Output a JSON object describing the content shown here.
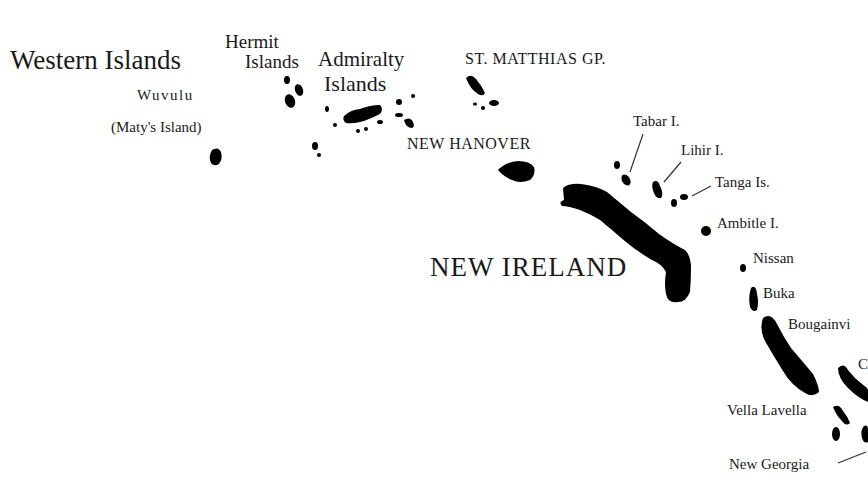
{
  "map": {
    "land_color": "#000000",
    "background_color": "#ffffff",
    "labels": {
      "western_islands": "Western Islands",
      "hermit_1": "Hermit",
      "hermit_2": "Islands",
      "admiralty_1": "Admiralty",
      "admiralty_2": "Islands",
      "wuvulu": "Wuvulu",
      "maty": "(Maty's Island)",
      "st_matthias": "ST. MATTHIAS GP.",
      "new_hanover": "NEW HANOVER",
      "tabar": "Tabar I.",
      "lihir": "Lihir I.",
      "tanga": "Tanga Is.",
      "ambitle": "Ambitle I.",
      "new_ireland": "NEW IRELAND",
      "nissan": "Nissan",
      "buka": "Buka",
      "bougainville": "Bougainvi",
      "choiseul_partial": "C",
      "vella_lavella": "Vella Lavella",
      "new_georgia": "New Georgia"
    }
  }
}
